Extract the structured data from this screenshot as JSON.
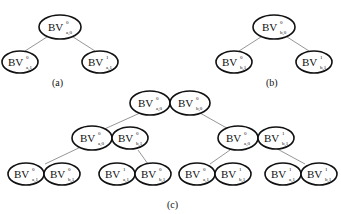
{
  "figure": {
    "panels": [
      {
        "caption": "(a)",
        "root": {
          "base": "BV",
          "sup": "0",
          "sub": "a,0"
        },
        "children": [
          {
            "base": "BV",
            "sup": "0",
            "sub": "a,1"
          },
          {
            "base": "BV",
            "sup": "1",
            "sub": "a,1"
          }
        ]
      },
      {
        "caption": "(b)",
        "root": {
          "base": "BV",
          "sup": "0",
          "sub": "b,0"
        },
        "children": [
          {
            "base": "BV",
            "sup": "0",
            "sub": "b,1"
          },
          {
            "base": "BV",
            "sup": "1",
            "sub": "b,1"
          }
        ]
      },
      {
        "caption": "(c)",
        "root": [
          {
            "base": "BV",
            "sup": "0",
            "sub": "a,0"
          },
          {
            "base": "BV",
            "sup": "0",
            "sub": "b,0"
          }
        ],
        "level1": [
          [
            {
              "base": "BV",
              "sup": "0",
              "sub": "a,0"
            },
            {
              "base": "BV",
              "sup": "0",
              "sub": "b,1"
            }
          ],
          [
            {
              "base": "BV",
              "sup": "0",
              "sub": "a,0"
            },
            {
              "base": "BV",
              "sup": "1",
              "sub": "b,1"
            }
          ]
        ],
        "level2": [
          [
            {
              "base": "BV",
              "sup": "0",
              "sub": "a,1"
            },
            {
              "base": "BV",
              "sup": "0",
              "sub": "b,1"
            }
          ],
          [
            {
              "base": "BV",
              "sup": "1",
              "sub": "a,1"
            },
            {
              "base": "BV",
              "sup": "0",
              "sub": "b,1"
            }
          ],
          [
            {
              "base": "BV",
              "sup": "0",
              "sub": "a,1"
            },
            {
              "base": "BV",
              "sup": "1",
              "sub": "b,1"
            }
          ],
          [
            {
              "base": "BV",
              "sup": "1",
              "sub": "a,1"
            },
            {
              "base": "BV",
              "sup": "1",
              "sub": "b,1"
            }
          ]
        ]
      }
    ]
  }
}
